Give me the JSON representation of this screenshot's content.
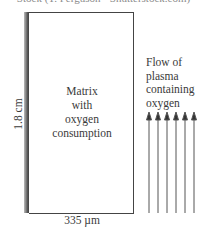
{
  "caption": "Stock (T. Ferguson • Shutterstock.com)",
  "diagram": {
    "matrix_label_lines": [
      "Matrix",
      "with",
      "oxygen",
      "consumption"
    ],
    "height_label": "1.8 cm",
    "width_label": "335 µm",
    "flow_label_lines": [
      "Flow of",
      "plasma",
      "containing",
      "oxygen"
    ],
    "arrow_count": 6,
    "arrow_direction": "up"
  }
}
